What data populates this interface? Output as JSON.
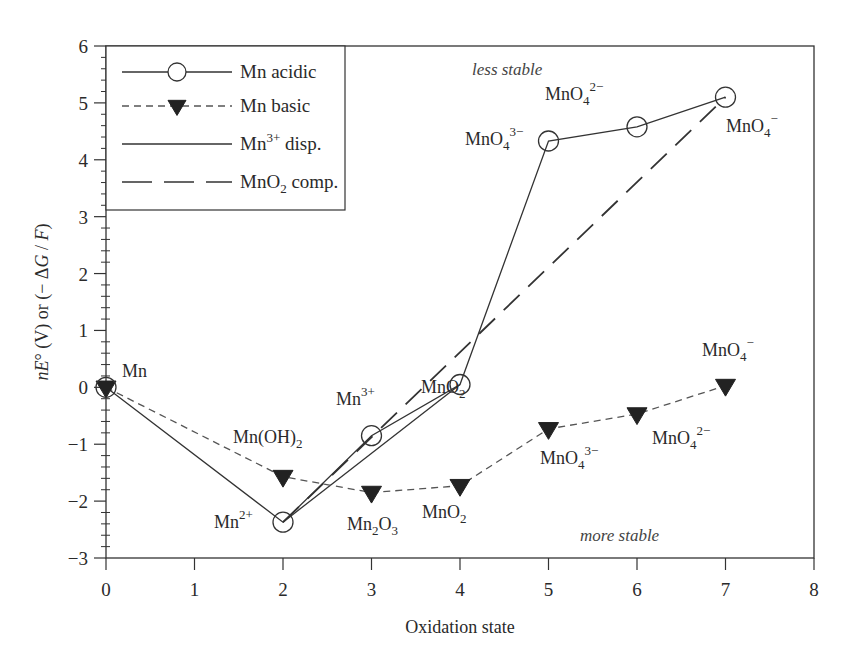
{
  "chart_data": {
    "type": "line",
    "title": "",
    "xlabel": "Oxidation state",
    "ylabel": "nE° (V) or (− ΔG / F)",
    "xlim": [
      0,
      8
    ],
    "ylim": [
      -3,
      6
    ],
    "x_ticks": [
      0,
      1,
      2,
      3,
      4,
      5,
      6,
      7,
      8
    ],
    "y_ticks": [
      -3,
      -2,
      -1,
      0,
      1,
      2,
      3,
      4,
      5,
      6
    ],
    "y_minor_step": 0.2,
    "grid": false,
    "legend_position": "upper-left",
    "series": [
      {
        "name": "Mn acidic",
        "style": "solid",
        "marker": "open-circle",
        "x": [
          0,
          2,
          3,
          4,
          5,
          6,
          7
        ],
        "y": [
          0,
          -2.37,
          -0.85,
          0.05,
          4.33,
          4.58,
          5.1
        ],
        "labels": [
          "Mn",
          "Mn2+",
          "Mn3+",
          "MnO2",
          "MnO4 3−",
          "MnO4 2−",
          "MnO4 −"
        ]
      },
      {
        "name": "Mn basic",
        "style": "dashed",
        "marker": "filled-down-triangle",
        "x": [
          0,
          2,
          3,
          4,
          5,
          6,
          7
        ],
        "y": [
          0,
          -1.57,
          -1.85,
          -1.73,
          -0.73,
          -0.47,
          0.03
        ],
        "labels": [
          "Mn",
          "Mn(OH)2",
          "Mn2O3",
          "MnO2",
          "MnO4 3−",
          "MnO4 2−",
          "MnO4 −"
        ]
      },
      {
        "name": "Mn3+ disp.",
        "style": "solid",
        "marker": "none",
        "x": [
          2,
          4
        ],
        "y": [
          -2.37,
          0.05
        ]
      },
      {
        "name": "MnO2 comp.",
        "style": "long-dash",
        "marker": "none",
        "x": [
          2,
          7
        ],
        "y": [
          -2.37,
          5.1
        ]
      }
    ],
    "annotations": [
      {
        "text": "less stable",
        "x": 3.6,
        "y": 5.6,
        "style": "italic"
      },
      {
        "text": "more stable",
        "x": 5.55,
        "y": -2.6,
        "style": "italic"
      }
    ]
  },
  "legend": {
    "items": [
      "Mn acidic",
      "Mn basic",
      "Mn3+ disp.",
      "MnO2 comp."
    ]
  },
  "labels": {
    "xlabel": "Oxidation state",
    "region_top": "less stable",
    "region_bottom": "more stable"
  }
}
